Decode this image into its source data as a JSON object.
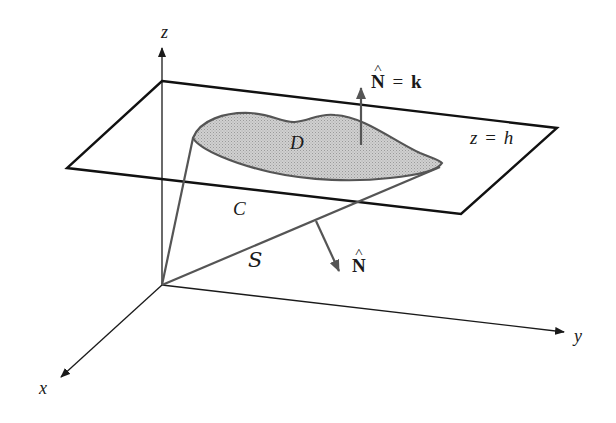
{
  "figure": {
    "axes": {
      "x_label": "x",
      "y_label": "y",
      "z_label": "z"
    },
    "plane": {
      "label_var": "z",
      "label_eq": "=",
      "label_val": "h"
    },
    "region": {
      "label": "D",
      "fill_color": "#c8c8c8",
      "stroke_color": "#555555"
    },
    "curve": {
      "label": "C"
    },
    "surface": {
      "label": "S"
    },
    "normals": {
      "top": {
        "symbol": "N",
        "eq": "=",
        "value": "k"
      },
      "side": {
        "symbol": "N"
      }
    },
    "colors": {
      "axis": "#1a1a1a",
      "plane": "#111111",
      "arrow": "#555555"
    }
  }
}
